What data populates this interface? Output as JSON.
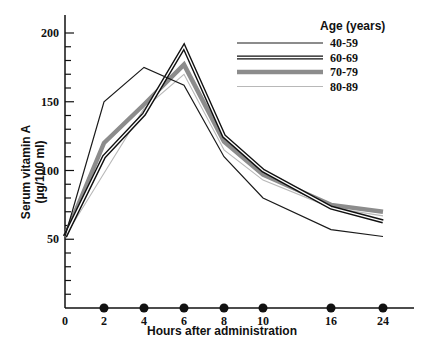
{
  "chart_data": {
    "type": "line",
    "title": "",
    "xlabel": "Hours after administration",
    "ylabel": "Serum vitamin A",
    "ylabel_units": "(µg/100 ml)",
    "x": [
      0,
      2,
      4,
      6,
      8,
      10,
      16,
      24
    ],
    "x_tick_labels": [
      "0",
      "2",
      "4",
      "6",
      "8",
      "10",
      "16",
      "24"
    ],
    "y_tick_labels": [
      "50",
      "100",
      "150",
      "200"
    ],
    "ylim": [
      0,
      210
    ],
    "grid": false,
    "legend_title": "Age (years)",
    "legend_position": "top-right",
    "sample_markers": "filled circles on x-axis at each sampling time",
    "series": [
      {
        "name": "40-59",
        "style": "thin-black",
        "values": [
          52,
          150,
          175,
          162,
          110,
          80,
          57,
          52
        ]
      },
      {
        "name": "60-69",
        "style": "double-black",
        "values": [
          52,
          110,
          141,
          190,
          125,
          100,
          73,
          63
        ]
      },
      {
        "name": "70-79",
        "style": "thick-gray",
        "values": [
          52,
          120,
          148,
          177,
          121,
          97,
          75,
          70
        ]
      },
      {
        "name": "80-89",
        "style": "thin-lightgray",
        "values": [
          52,
          98,
          145,
          170,
          115,
          93,
          73,
          67
        ]
      }
    ]
  }
}
